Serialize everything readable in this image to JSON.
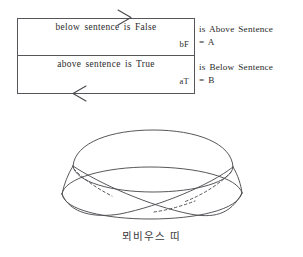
{
  "figure": {
    "caption": "뫼비우스 띠",
    "paradox": {
      "upper": {
        "sentence": "below sentence is False",
        "tag": "bF",
        "annotation": "is Above Sentence",
        "equals": "= A"
      },
      "lower": {
        "sentence": "above sentence is True",
        "tag": "aT",
        "annotation": "is Below Sentence",
        "equals": "= B"
      }
    },
    "arrows": {
      "top": "arrow-right-icon",
      "bottom": "arrow-left-icon"
    },
    "colors": {
      "ink": "#2b2b2b",
      "line": "#56565a",
      "paper": "#ffffff"
    }
  }
}
